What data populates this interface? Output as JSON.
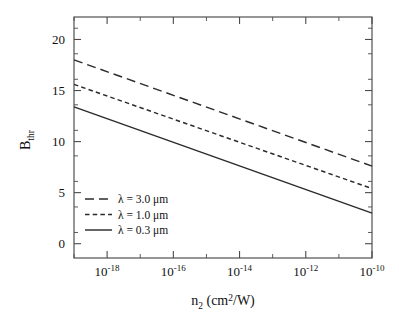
{
  "figure": {
    "background_color": "#ffffff",
    "line_color": "#2b2b2b",
    "axis_color": "#4a4a4a"
  },
  "chart_data": {
    "type": "line",
    "title": "",
    "xlabel": "n_2 (cm^2/W)",
    "xlabel_parts": {
      "base": "n",
      "sub": "2",
      "open": " (cm",
      "sup": "2",
      "close": "/W)"
    },
    "ylabel": "B_thr",
    "ylabel_parts": {
      "base": "B",
      "sub": "thr"
    },
    "xscale": "log",
    "yscale": "linear",
    "xlim": [
      1e-19,
      1e-10
    ],
    "ylim": [
      -1.4,
      22.2
    ],
    "grid": false,
    "legend_position": "lower left inside axes",
    "xticks": [
      {
        "value": 1e-18,
        "mantissa": "10",
        "exponent": "-18"
      },
      {
        "value": 1e-16,
        "mantissa": "10",
        "exponent": "-16"
      },
      {
        "value": 1e-14,
        "mantissa": "10",
        "exponent": "-14"
      },
      {
        "value": 1e-12,
        "mantissa": "10",
        "exponent": "-12"
      },
      {
        "value": 1e-10,
        "mantissa": "10",
        "exponent": "-10"
      }
    ],
    "xminorticks": [
      1e-19,
      1e-17,
      1e-15,
      1e-13,
      1e-11
    ],
    "yticks": [
      0,
      5,
      10,
      15,
      20
    ],
    "series": [
      {
        "name": "lambda = 3.0 um",
        "label_parts": {
          "symbol": "λ",
          "eq": " = ",
          "value": "3.0",
          "unit": " μm"
        },
        "style": "long-dash",
        "dasharray": "9,5",
        "x": [
          1e-19,
          1e-10
        ],
        "y": [
          18.0,
          7.6
        ]
      },
      {
        "name": "lambda = 1.0 um",
        "label_parts": {
          "symbol": "λ",
          "eq": " = ",
          "value": "1.0",
          "unit": " μm"
        },
        "style": "short-dash",
        "dasharray": "4.5,3.2",
        "x": [
          1e-19,
          1e-10
        ],
        "y": [
          15.6,
          5.4
        ]
      },
      {
        "name": "lambda = 0.3 um",
        "label_parts": {
          "symbol": "λ",
          "eq": " = ",
          "value": "0.3",
          "unit": " μm"
        },
        "style": "solid",
        "dasharray": "none",
        "x": [
          1e-19,
          1e-10
        ],
        "y": [
          13.4,
          3.0
        ]
      }
    ]
  }
}
